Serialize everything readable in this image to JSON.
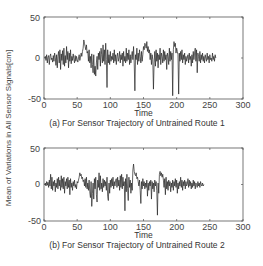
{
  "figure": {
    "ylabel": "Mean of Variations in All Sensor Signals[cm]"
  },
  "chart_data": [
    {
      "type": "line",
      "title": "(a) For Sensor Trajectory of Untrained Route 1",
      "xlabel": "Time",
      "ylabel": "Mean of Variations in All Sensor Signals[cm]",
      "xlim": [
        0,
        300
      ],
      "ylim": [
        -50,
        50
      ],
      "xticks": [
        0,
        50,
        100,
        150,
        200,
        250,
        300
      ],
      "yticks": [
        -50,
        0,
        50
      ],
      "grid": false,
      "color": "#222222",
      "x_range": [
        1,
        265
      ],
      "values": [
        0,
        2,
        -3,
        4,
        -6,
        1,
        3,
        -8,
        2,
        5,
        -2,
        0,
        -5,
        3,
        -4,
        6,
        1,
        -9,
        4,
        -12,
        2,
        8,
        -6,
        10,
        -14,
        5,
        -3,
        9,
        -8,
        12,
        -10,
        3,
        -6,
        14,
        -2,
        8,
        -12,
        6,
        -4,
        10,
        -7,
        2,
        -3,
        5,
        -1,
        -6,
        3,
        -4,
        2,
        -2,
        -5,
        0,
        4,
        -3,
        1,
        6,
        2,
        8,
        12,
        22,
        18,
        14,
        10,
        16,
        6,
        8,
        -4,
        10,
        -6,
        2,
        -12,
        5,
        -8,
        -18,
        4,
        -20,
        -10,
        -22,
        -6,
        2,
        -14,
        6,
        -2,
        8,
        -10,
        12,
        4,
        -6,
        16,
        -4,
        10,
        -8,
        18,
        -2,
        -36,
        10,
        -6,
        4,
        -8,
        8,
        -4,
        2,
        -2,
        6,
        -6,
        10,
        -4,
        4,
        -8,
        2,
        6,
        -4,
        0,
        8,
        -6,
        4,
        -2,
        6,
        -10,
        8,
        -4,
        2,
        -6,
        12,
        -4,
        6,
        -2,
        10,
        -8,
        4,
        -6,
        2,
        8,
        -2,
        14,
        -6,
        -40,
        4,
        -2,
        12,
        -8,
        6,
        -4,
        10,
        2,
        -6,
        8,
        -4,
        4,
        14,
        10,
        18,
        16,
        12,
        20,
        8,
        14,
        6,
        10,
        -2,
        6,
        -8,
        4,
        -2,
        -38,
        -6,
        8,
        -10,
        10,
        -4,
        6,
        -12,
        4,
        -2,
        12,
        -8,
        6,
        2,
        -6,
        10,
        -4,
        8,
        -2,
        4,
        -14,
        6,
        2,
        -8,
        12,
        -4,
        8,
        -2,
        6,
        -46,
        10,
        20,
        14,
        18,
        6,
        12,
        8,
        4,
        -44,
        6,
        -4,
        8,
        -2,
        10,
        -6,
        4,
        -2,
        6,
        -8,
        2,
        -4,
        0,
        4,
        -6,
        6,
        -2,
        2,
        -10,
        4,
        -6,
        8,
        -2,
        6,
        12,
        -4,
        10,
        -18,
        6,
        2,
        -4,
        8,
        -6,
        4,
        -2,
        6,
        -4,
        2,
        -6,
        4,
        0,
        -4,
        6,
        -2,
        2,
        -6,
        4,
        -2,
        0,
        -4,
        6,
        -2,
        2,
        -4,
        4,
        0
      ]
    },
    {
      "type": "line",
      "title": "(b) For Sensor Trajectory of Untrained Route 2",
      "xlabel": "Time",
      "ylabel": "Mean of Variations in All Sensor Signals[cm]",
      "xlim": [
        0,
        300
      ],
      "ylim": [
        -50,
        50
      ],
      "xticks": [
        0,
        50,
        100,
        150,
        200,
        250,
        300
      ],
      "yticks": [
        -50,
        0,
        50
      ],
      "grid": false,
      "color": "#222222",
      "x_range": [
        1,
        266
      ],
      "values": [
        0,
        2,
        -2,
        4,
        -1,
        3,
        -4,
        6,
        -2,
        14,
        -6,
        10,
        -8,
        4,
        -2,
        6,
        -10,
        2,
        -4,
        8,
        -6,
        10,
        -2,
        6,
        -8,
        12,
        -4,
        8,
        -6,
        10,
        -12,
        4,
        -2,
        8,
        -6,
        10,
        -4,
        6,
        -14,
        8,
        -4,
        2,
        -8,
        4,
        -2,
        6,
        -4,
        0,
        -6,
        4,
        2,
        6,
        10,
        16,
        12,
        14,
        8,
        10,
        4,
        6,
        -2,
        8,
        -4,
        10,
        -6,
        2,
        -8,
        6,
        -10,
        -18,
        4,
        -30,
        -12,
        2,
        -20,
        8,
        -6,
        10,
        -14,
        -24,
        6,
        -4,
        16,
        -8,
        12,
        -6,
        2,
        -10,
        8,
        -4,
        6,
        -2,
        4,
        -8,
        10,
        -16,
        -22,
        2,
        -12,
        6,
        -4,
        8,
        -2,
        10,
        -6,
        4,
        -2,
        6,
        8,
        -4,
        10,
        -2,
        6,
        -8,
        12,
        -4,
        14,
        -6,
        10,
        -2,
        4,
        -36,
        8,
        -10,
        14,
        -6,
        -22,
        10,
        -4,
        6,
        -12,
        2,
        -8,
        20,
        28,
        18,
        14,
        12,
        16,
        8,
        10,
        4,
        -2,
        6,
        -8,
        -26,
        4,
        -6,
        8,
        -2,
        4,
        -6,
        2,
        -4,
        6,
        -16,
        2,
        -8,
        4,
        -2,
        6,
        -20,
        4,
        -6,
        2,
        -10,
        6,
        -2,
        4,
        -8,
        -42,
        2,
        -12,
        14,
        18,
        12,
        16,
        10,
        14,
        6,
        -4,
        8,
        -14,
        10,
        -6,
        4,
        -8,
        6,
        -2,
        4,
        -10,
        2,
        -4,
        6,
        -8,
        4,
        -2,
        8,
        -4,
        6,
        -12,
        2,
        -6,
        4,
        -2,
        10,
        -4,
        6,
        -8,
        4,
        -2,
        6,
        -6,
        4,
        -2,
        0,
        8,
        -4,
        6,
        -2,
        4,
        -6,
        2,
        -4,
        6,
        -2,
        4,
        -6,
        2,
        0,
        -4,
        4,
        -2,
        2,
        -4,
        4,
        0,
        -2,
        2,
        -2,
        0
      ]
    }
  ],
  "plots": [
    {
      "xticks": [
        "0",
        "50",
        "100",
        "150",
        "200",
        "250",
        "300"
      ],
      "yticks": [
        "50",
        "0",
        "-50"
      ],
      "xlabel": "Time",
      "caption": "(a) For Sensor Trajectory of Untrained Route 1"
    },
    {
      "xticks": [
        "0",
        "50",
        "100",
        "150",
        "200",
        "250",
        "300"
      ],
      "yticks": [
        "50",
        "0",
        "-50"
      ],
      "xlabel": "Time",
      "caption": "(b) For Sensor Trajectory of Untrained Route 2"
    }
  ]
}
